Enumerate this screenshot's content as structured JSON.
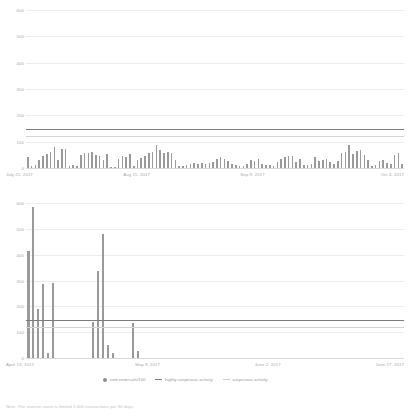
{
  "legend": {
    "items": [
      {
        "label": "sum reversals/100",
        "marker": "dot-icon"
      },
      {
        "label": "highly suspicious activity",
        "marker": "line-icon"
      },
      {
        "label": "suspicious activity",
        "marker": "line-light-icon"
      }
    ]
  },
  "footnote": {
    "text": "Note: The reverse count is limited 1,000 transactions per 90 days"
  },
  "colors": {
    "bar": "#9a9a9a",
    "highly_suspicious_line": "#7d7d7d",
    "suspicious_line": "#d4d4d4",
    "gridline": "#ededed",
    "text": "#a8a8a8"
  },
  "chart_data": [
    {
      "type": "bar",
      "title": "",
      "xlabel": "",
      "ylabel": "",
      "ylim": [
        0,
        600
      ],
      "yticks": [
        0,
        100,
        200,
        300,
        400,
        500,
        600
      ],
      "ytick_labels": [
        "0",
        "100",
        "200",
        "300",
        "400",
        "500",
        "600"
      ],
      "grid": true,
      "xtick_labels": [
        "July 21, 2017",
        "Aug 15, 2017",
        "Sep 9, 2017",
        "Oct 4, 2017"
      ],
      "xtick_positions": [
        0,
        31,
        62,
        93
      ],
      "series": [
        {
          "name": "sum reversals/100",
          "values": [
            42,
            8,
            12,
            30,
            46,
            55,
            62,
            80,
            32,
            72,
            74,
            6,
            10,
            8,
            50,
            56,
            58,
            60,
            50,
            44,
            30,
            52,
            5,
            4,
            34,
            44,
            42,
            54,
            6,
            30,
            38,
            44,
            56,
            60,
            88,
            70,
            56,
            62,
            58,
            30,
            8,
            6,
            12,
            14,
            18,
            16,
            20,
            14,
            18,
            24,
            36,
            40,
            34,
            28,
            14,
            10,
            8,
            6,
            16,
            30,
            28,
            34,
            16,
            12,
            10,
            8,
            24,
            36,
            40,
            44,
            46,
            22,
            34,
            12,
            10,
            14,
            42,
            26,
            30,
            34,
            22,
            16,
            26,
            56,
            62,
            86,
            52,
            64,
            70,
            50,
            30,
            8,
            12,
            26,
            32,
            20,
            14,
            48,
            56,
            14
          ]
        }
      ],
      "threshold_lines": [
        {
          "name": "highly suspicious activity",
          "value": 148,
          "color": "#7d7d7d"
        },
        {
          "name": "suspicious activity",
          "value": 120,
          "color": "#d4d4d4"
        }
      ]
    },
    {
      "type": "bar",
      "title": "",
      "xlabel": "",
      "ylabel": "",
      "ylim": [
        0,
        600
      ],
      "yticks": [
        0,
        100,
        200,
        300,
        400,
        500,
        600
      ],
      "ytick_labels": [
        "0",
        "100",
        "200",
        "300",
        "400",
        "500",
        "600"
      ],
      "grid": true,
      "xtick_labels": [
        "April 13, 2017",
        "May 9, 2017",
        "June 2, 2017",
        "June 27, 2017"
      ],
      "xtick_positions": [
        0,
        26,
        50,
        75
      ],
      "series": [
        {
          "name": "sum reversals/100",
          "values": [
            415,
            585,
            190,
            285,
            18,
            292,
            0,
            0,
            0,
            0,
            0,
            0,
            0,
            140,
            335,
            480,
            50,
            20,
            0,
            0,
            0,
            135,
            28,
            0,
            0,
            0,
            0,
            0,
            0,
            0,
            0,
            0,
            0,
            0,
            0,
            0,
            0,
            0,
            0,
            0,
            0,
            0,
            0,
            0,
            0,
            0,
            0,
            0,
            0,
            0,
            0,
            0,
            0,
            0,
            0,
            0,
            0,
            0,
            0,
            0,
            0,
            0,
            0,
            0,
            0,
            0,
            0,
            0,
            0,
            0,
            0,
            0,
            0,
            0,
            0,
            0
          ]
        }
      ],
      "threshold_lines": [
        {
          "name": "highly suspicious activity",
          "value": 148,
          "color": "#7d7d7d"
        },
        {
          "name": "suspicious activity",
          "value": 120,
          "color": "#d4d4d4"
        }
      ]
    }
  ]
}
